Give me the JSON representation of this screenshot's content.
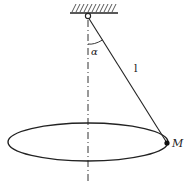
{
  "diagram": {
    "type": "conical pendulum",
    "labels": {
      "angle": "α",
      "length": "l",
      "point": "M"
    },
    "colors": {
      "line": "#222222",
      "background": "#ffffff"
    }
  }
}
